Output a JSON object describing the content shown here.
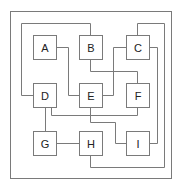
{
  "diagram": {
    "colors": {
      "line": "#7a7a7a",
      "box_fill": "#ffffff",
      "text": "#222222",
      "background": "#ffffff"
    },
    "frame": {
      "x": 10,
      "y": 11,
      "w": 161,
      "h": 167
    },
    "nodes": [
      {
        "id": "A",
        "label": "A",
        "x": 33,
        "y": 35,
        "w": 23,
        "h": 24
      },
      {
        "id": "B",
        "label": "B",
        "x": 79,
        "y": 35,
        "w": 23,
        "h": 24
      },
      {
        "id": "C",
        "label": "C",
        "x": 126,
        "y": 35,
        "w": 23,
        "h": 24
      },
      {
        "id": "D",
        "label": "D",
        "x": 33,
        "y": 83,
        "w": 23,
        "h": 24
      },
      {
        "id": "E",
        "label": "E",
        "x": 79,
        "y": 83,
        "w": 23,
        "h": 24
      },
      {
        "id": "F",
        "label": "F",
        "x": 126,
        "y": 83,
        "w": 23,
        "h": 24
      },
      {
        "id": "G",
        "label": "G",
        "x": 33,
        "y": 131,
        "w": 23,
        "h": 24
      },
      {
        "id": "H",
        "label": "H",
        "x": 79,
        "y": 131,
        "w": 23,
        "h": 24
      },
      {
        "id": "I",
        "label": "I",
        "x": 126,
        "y": 131,
        "w": 23,
        "h": 24
      }
    ],
    "edges": [
      {
        "from": "A",
        "to": "E",
        "points": "56,47 68,47 68,95 79,95"
      },
      {
        "from": "B",
        "to": "F",
        "points": "90,59 90,71 137,71 137,83"
      },
      {
        "from": "C",
        "to": "E",
        "points": "126,47 113,47 113,95 102,95"
      },
      {
        "from": "D",
        "to": "B",
        "points": "33,95 21,95 21,23 90,23 90,35"
      },
      {
        "from": "D",
        "to": "F",
        "points": "51,107 51,115 137,115 137,107"
      },
      {
        "from": "E",
        "to": "I",
        "points": "90,107 90,122 115,122 115,143 126,143"
      },
      {
        "from": "D",
        "to": "G",
        "points": "45,107 45,131"
      },
      {
        "from": "G",
        "to": "H",
        "points": "56,143 79,143"
      },
      {
        "from": "C",
        "to": "H",
        "points": "137,35 137,23 164,23 164,167 90,167 90,155"
      },
      {
        "from": "C",
        "to": "I",
        "points": "149,47 157,47 157,143 149,143"
      }
    ]
  }
}
